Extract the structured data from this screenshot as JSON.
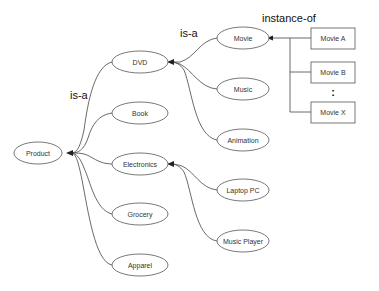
{
  "diagram": {
    "type": "taxonomy",
    "labels": {
      "is_a_1": "is-a",
      "is_a_2": "is-a",
      "instance_of": "instance-of",
      "ellipsis": ":"
    },
    "nodes": {
      "product": "Product",
      "dvd": "DVD",
      "book": "Book",
      "electronics": "Electronics",
      "grocery": "Grocery",
      "apparel": "Apparel",
      "movie": "Movie",
      "music": "Music",
      "animation": "Animation",
      "laptop_pc": "Laptop PC",
      "music_player": "Music Player"
    },
    "instances": {
      "movie_a": "Movie A",
      "movie_b": "Movie B",
      "movie_x": "Movie X"
    },
    "edges": [
      {
        "from": "DVD",
        "to": "Product",
        "relation": "is-a"
      },
      {
        "from": "Book",
        "to": "Product",
        "relation": "is-a"
      },
      {
        "from": "Electronics",
        "to": "Product",
        "relation": "is-a"
      },
      {
        "from": "Grocery",
        "to": "Product",
        "relation": "is-a"
      },
      {
        "from": "Apparel",
        "to": "Product",
        "relation": "is-a"
      },
      {
        "from": "Movie",
        "to": "DVD",
        "relation": "is-a"
      },
      {
        "from": "Music",
        "to": "DVD",
        "relation": "is-a"
      },
      {
        "from": "Animation",
        "to": "DVD",
        "relation": "is-a"
      },
      {
        "from": "Laptop PC",
        "to": "Electronics",
        "relation": "is-a"
      },
      {
        "from": "Music Player",
        "to": "Electronics",
        "relation": "is-a"
      },
      {
        "from": "Movie A",
        "to": "Movie",
        "relation": "instance-of"
      },
      {
        "from": "Movie B",
        "to": "Movie",
        "relation": "instance-of"
      },
      {
        "from": "Movie X",
        "to": "Movie",
        "relation": "instance-of"
      }
    ],
    "colors": {
      "stroke": "#555555",
      "text": "#333333",
      "background": "#ffffff"
    }
  }
}
